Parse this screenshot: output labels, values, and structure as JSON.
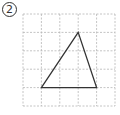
{
  "figure": {
    "label": "2",
    "label_style": "circled-number",
    "grid": {
      "columns": 5,
      "rows": 5,
      "origin_px": [
        23,
        14
      ],
      "cell_px": 18.4,
      "line_style": "dashed",
      "line_color": "#b5b5b5"
    },
    "shape": {
      "type": "triangle",
      "stroke": "#333333",
      "vertices_grid": [
        [
          3,
          1
        ],
        [
          1,
          4
        ],
        [
          4,
          4
        ]
      ]
    }
  }
}
